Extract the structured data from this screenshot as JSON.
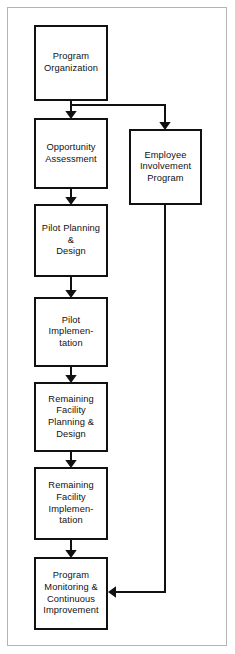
{
  "figure": {
    "type": "process-flowchart",
    "orientation": "vertical",
    "background_color": "#ffffff",
    "border_color": "#b4b4b4",
    "box_border_color": "#111111",
    "connector_color": "#111111"
  },
  "nodes": [
    {
      "id": "program-organization",
      "label": "Program\nOrganization",
      "column": "main",
      "x": 34,
      "y": 25,
      "w": 74,
      "h": 76
    },
    {
      "id": "opportunity-assessment",
      "label": "Opportunity\nAssessment",
      "column": "main",
      "x": 34,
      "y": 118,
      "w": 74,
      "h": 71
    },
    {
      "id": "employee-involvement-program",
      "label": "Employee\nInvolvement\nProgram",
      "column": "side",
      "x": 129,
      "y": 129,
      "w": 73,
      "h": 76
    },
    {
      "id": "pilot-planning-design",
      "label": "Pilot Planning\n&\nDesign",
      "column": "main",
      "x": 34,
      "y": 204,
      "w": 74,
      "h": 73
    },
    {
      "id": "pilot-implementation",
      "label": "Pilot\nImplemen-\ntation",
      "column": "main",
      "x": 34,
      "y": 297,
      "w": 74,
      "h": 70
    },
    {
      "id": "remaining-facility-planning-design",
      "label": "Remaining\nFacility\nPlanning &\nDesign",
      "column": "main",
      "x": 34,
      "y": 382,
      "w": 74,
      "h": 70
    },
    {
      "id": "remaining-facility-implementation",
      "label": "Remaining\nFacility\nImplemen-\ntation",
      "column": "main",
      "x": 34,
      "y": 467,
      "w": 74,
      "h": 73
    },
    {
      "id": "program-monitoring-continuous-improvement",
      "label": "Program\nMonitoring &\nContinuous\nImprovement",
      "column": "main",
      "x": 34,
      "y": 557,
      "w": 74,
      "h": 73
    }
  ],
  "connectors": [
    {
      "id": "org-to-opportunity",
      "from": "program-organization",
      "to": "opportunity-assessment",
      "kind": "straight-down"
    },
    {
      "id": "org-to-employee",
      "from": "program-organization",
      "to": "employee-involvement-program",
      "kind": "branch-right-down"
    },
    {
      "id": "opportunity-to-pilot-planning",
      "from": "opportunity-assessment",
      "to": "pilot-planning-design",
      "kind": "straight-down"
    },
    {
      "id": "pilot-planning-to-pilot-implementation",
      "from": "pilot-planning-design",
      "to": "pilot-implementation",
      "kind": "straight-down"
    },
    {
      "id": "pilot-implementation-to-remaining-planning",
      "from": "pilot-implementation",
      "to": "remaining-facility-planning-design",
      "kind": "straight-down"
    },
    {
      "id": "remaining-planning-to-remaining-implementation",
      "from": "remaining-facility-planning-design",
      "to": "remaining-facility-implementation",
      "kind": "straight-down"
    },
    {
      "id": "remaining-implementation-to-monitoring",
      "from": "remaining-facility-implementation",
      "to": "program-monitoring-continuous-improvement",
      "kind": "straight-down"
    },
    {
      "id": "employee-to-monitoring",
      "from": "employee-involvement-program",
      "to": "program-monitoring-continuous-improvement",
      "kind": "down-then-left"
    }
  ]
}
